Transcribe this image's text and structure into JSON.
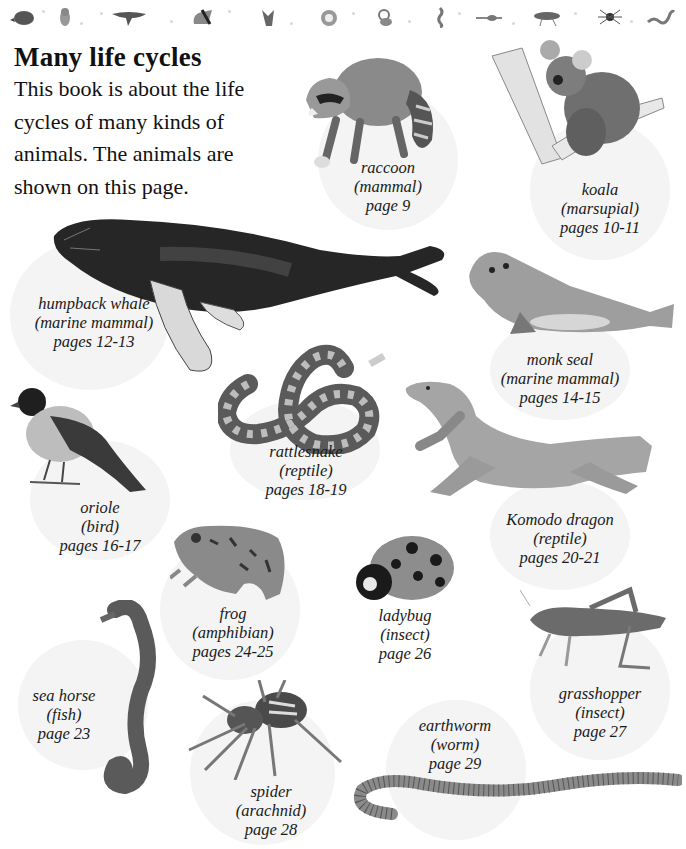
{
  "header": {
    "icon_strip": [
      "mole-icon",
      "owl-icon",
      "whale-icon",
      "koala-icon",
      "raccoon-icon",
      "snake-icon",
      "frog-icon",
      "seahorse-icon",
      "lizard-icon",
      "grasshopper-icon",
      "spider-icon",
      "worm-icon"
    ]
  },
  "page": {
    "title": "Many life cycles",
    "intro": "This book is about the life cycles of many kinds of animals. The animals are shown on this page."
  },
  "animals": [
    {
      "name": "raccoon",
      "class": "(mammal)",
      "pages": "page 9"
    },
    {
      "name": "koala",
      "class": "(marsupial)",
      "pages": "pages 10-11"
    },
    {
      "name": "humpback whale",
      "class": "(marine mammal)",
      "pages": "pages 12-13"
    },
    {
      "name": "monk seal",
      "class": "(marine mammal)",
      "pages": "pages 14-15"
    },
    {
      "name": "rattlesnake",
      "class": "(reptile)",
      "pages": "pages 18-19"
    },
    {
      "name": "oriole",
      "class": "(bird)",
      "pages": "pages 16-17"
    },
    {
      "name": "Komodo dragon",
      "class": "(reptile)",
      "pages": "pages 20-21"
    },
    {
      "name": "frog",
      "class": "(amphibian)",
      "pages": "pages 24-25"
    },
    {
      "name": "ladybug",
      "class": "(insect)",
      "pages": "page 26"
    },
    {
      "name": "grasshopper",
      "class": "(insect)",
      "pages": "page 27"
    },
    {
      "name": "sea horse",
      "class": "(fish)",
      "pages": "page 23"
    },
    {
      "name": "earthworm",
      "class": "(worm)",
      "pages": "page 29"
    },
    {
      "name": "spider",
      "class": "(arachnid)",
      "pages": "page 28"
    }
  ],
  "colors": {
    "bubble": "#f4f4f4",
    "ink": "#1a1a1a",
    "art_dark": "#2b2b2b",
    "art_mid": "#7a7a7a",
    "art_light": "#bdbdbd"
  }
}
